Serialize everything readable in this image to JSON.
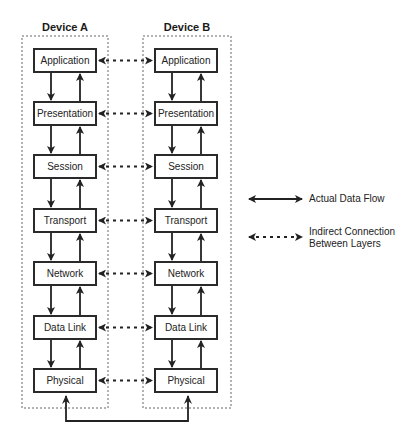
{
  "devices": [
    {
      "title": "Device A",
      "layers": [
        "Application",
        "Presentation",
        "Session",
        "Transport",
        "Network",
        "Data Link",
        "Physical"
      ]
    },
    {
      "title": "Device B",
      "layers": [
        "Application",
        "Presentation",
        "Session",
        "Transport",
        "Network",
        "Data Link",
        "Physical"
      ]
    }
  ],
  "legend": {
    "actual": "Actual Data Flow",
    "indirect_line1": "Indirect Connection",
    "indirect_line2": "Between Layers"
  },
  "colors": {
    "line": "#222222",
    "dashed_container": "#555555"
  }
}
